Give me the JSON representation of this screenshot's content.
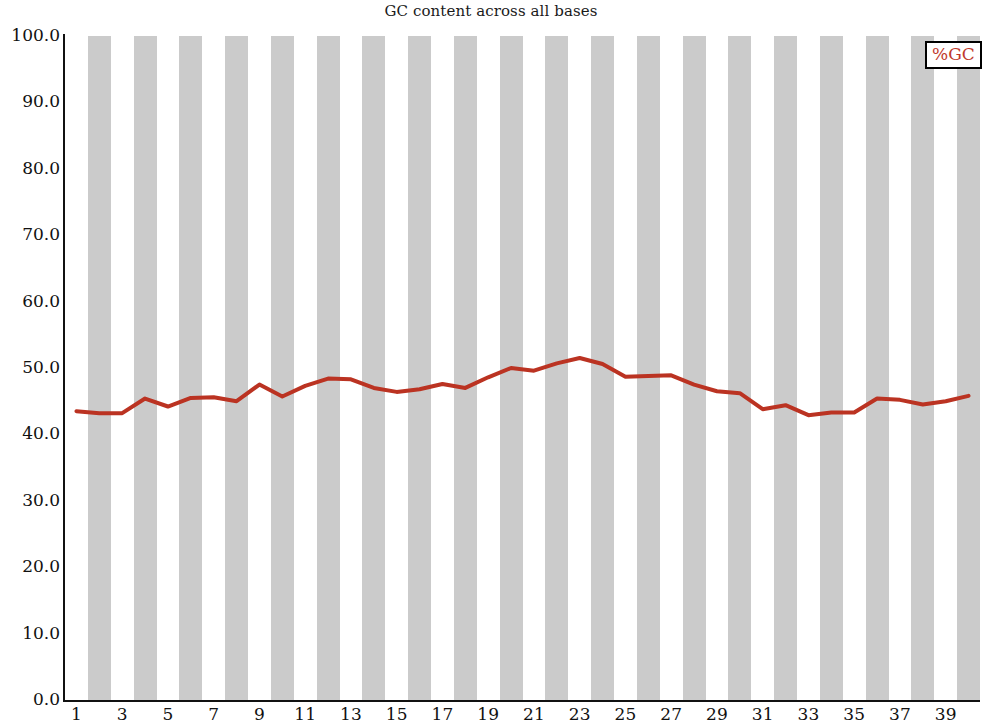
{
  "chart_data": {
    "type": "line",
    "title": "GC content across all bases",
    "xlabel": "",
    "ylabel": "",
    "xlim": [
      0.5,
      40.5
    ],
    "ylim": [
      0.0,
      100.0
    ],
    "grid": false,
    "legend_position": "top-right",
    "legend_entries": [
      "%GC"
    ],
    "y_ticks": [
      "100.0",
      "90.0",
      "80.0",
      "70.0",
      "60.0",
      "50.0",
      "40.0",
      "30.0",
      "20.0",
      "10.0",
      "0.0"
    ],
    "y_tick_values": [
      100.0,
      90.0,
      80.0,
      70.0,
      60.0,
      50.0,
      40.0,
      30.0,
      20.0,
      10.0,
      0.0
    ],
    "x_ticks": [
      "1",
      "3",
      "5",
      "7",
      "9",
      "11",
      "13",
      "15",
      "17",
      "19",
      "21",
      "23",
      "25",
      "27",
      "29",
      "31",
      "33",
      "35",
      "37",
      "39"
    ],
    "x_tick_values": [
      1,
      3,
      5,
      7,
      9,
      11,
      13,
      15,
      17,
      19,
      21,
      23,
      25,
      27,
      29,
      31,
      33,
      35,
      37,
      39
    ],
    "x": [
      1,
      2,
      3,
      4,
      5,
      6,
      7,
      8,
      9,
      10,
      11,
      12,
      13,
      14,
      15,
      16,
      17,
      18,
      19,
      20,
      21,
      22,
      23,
      24,
      25,
      26,
      27,
      28,
      29,
      30,
      31,
      32,
      33,
      34,
      35,
      36,
      37,
      38,
      39,
      40
    ],
    "series": [
      {
        "name": "%GC",
        "color": "#bb3322",
        "values": [
          43.5,
          43.2,
          43.2,
          45.4,
          44.2,
          45.5,
          45.6,
          45.0,
          47.5,
          45.7,
          47.3,
          48.4,
          48.3,
          47.0,
          46.4,
          46.8,
          47.6,
          47.0,
          48.6,
          50.0,
          49.6,
          50.7,
          51.5,
          50.6,
          48.7,
          48.8,
          48.9,
          47.5,
          46.5,
          46.2,
          43.8,
          44.4,
          42.9,
          43.3,
          43.3,
          45.4,
          45.2,
          44.5,
          45.0,
          45.8
        ]
      }
    ]
  },
  "legend": {
    "label": "%GC",
    "color": "#c0392b"
  },
  "bands": {
    "color": "#cbcbcb",
    "pattern": "alternating-even-bases-shaded"
  }
}
